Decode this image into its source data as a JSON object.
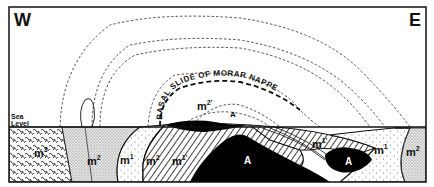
{
  "diagram": {
    "type": "geological-cross-section",
    "orientation": {
      "west_label": "W",
      "east_label": "E"
    },
    "sea_level_label": {
      "line1": "Sea",
      "line2": "Level"
    },
    "structure_label": "BASAL SLIDE OF MORAR NAPPE",
    "unit_labels": {
      "m3": {
        "base": "m",
        "sup": "3"
      },
      "m2_left": {
        "base": "m",
        "sup": "2"
      },
      "m1_left": {
        "base": "m",
        "sup": "1"
      },
      "m2_mid": {
        "base": "m",
        "sup": "2"
      },
      "m1_prime_left": {
        "base": "m",
        "sup": "1'"
      },
      "m2_prime_upper": {
        "base": "m",
        "sup": "2'"
      },
      "m1_prime_right": {
        "base": "m",
        "sup": "1'"
      },
      "m1_right": {
        "base": "m",
        "sup": "1"
      },
      "m2_right": {
        "base": "m",
        "sup": "2"
      }
    },
    "basement_labels": {
      "A_upper": "A",
      "A_core_left": "A",
      "A_core_right": "A"
    },
    "colors": {
      "line": "#111111",
      "background": "#ffffff",
      "basement_fill": "#000000"
    }
  }
}
